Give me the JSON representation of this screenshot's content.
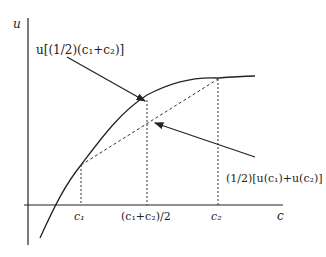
{
  "diagram": {
    "y_axis_label": "u",
    "x_axis_label": "c",
    "x_ticks": [
      {
        "id": "c1",
        "label": "c₁"
      },
      {
        "id": "mid",
        "label": "(c₁+c₂)/2"
      },
      {
        "id": "c2",
        "label": "c₂"
      }
    ],
    "annotations": {
      "utility_of_mean": "u[(1/2)(c₁+c₂)]",
      "mean_of_utility": "(1/2)[u(c₁)+u(c₂)]"
    },
    "colors": {
      "line": "#222222",
      "background": "#ffffff"
    }
  }
}
